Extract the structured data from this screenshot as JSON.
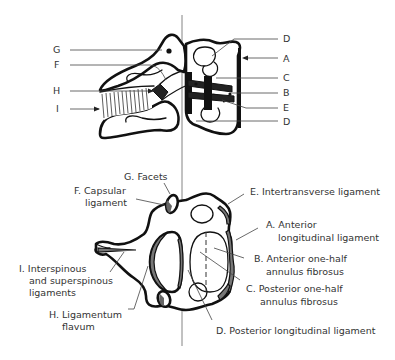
{
  "diagram": {
    "type": "anatomical-illustration",
    "lateral_view": {
      "left_labels": [
        {
          "key": "G",
          "text": "G"
        },
        {
          "key": "F",
          "text": "F"
        },
        {
          "key": "H",
          "text": "H"
        },
        {
          "key": "I",
          "text": "I"
        }
      ],
      "right_labels": [
        {
          "key": "D_top",
          "text": "D"
        },
        {
          "key": "A",
          "text": "A"
        },
        {
          "key": "C",
          "text": "C"
        },
        {
          "key": "B",
          "text": "B"
        },
        {
          "key": "E",
          "text": "E"
        },
        {
          "key": "D_bottom",
          "text": "D"
        }
      ]
    },
    "axial_view": {
      "labels": {
        "G": "G. Facets",
        "F_line1": "F. Capsular",
        "F_line2": "ligament",
        "E": "E. Intertransverse ligament",
        "A_line1": "A. Anterior",
        "A_line2": "longitudinal ligament",
        "B_line1": "B. Anterior one-half",
        "B_line2": "annulus fibrosus",
        "C_line1": "C. Posterior one-half",
        "C_line2": "annulus fibrosus",
        "I_line1": "I. Interspinous",
        "I_line2": "and superspinous",
        "I_line3": "ligaments",
        "H_line1": "H. Ligamentum",
        "H_line2": "flavum",
        "D": "D. Posterior longitudinal ligament"
      }
    },
    "colors": {
      "outline": "#111111",
      "text": "#333333",
      "leader": "#444444",
      "axis": "#777777",
      "shaded": "#777777",
      "background": "#ffffff"
    }
  }
}
